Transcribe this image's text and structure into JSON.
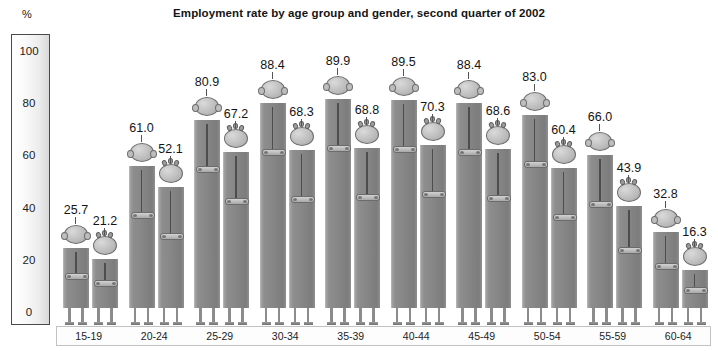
{
  "chart_data": {
    "type": "bar",
    "title": "Employment rate by age group and gender, second quarter of 2002",
    "xlabel": "",
    "ylabel": "%",
    "ylim": [
      0,
      100
    ],
    "yticks": [
      0,
      20,
      40,
      60,
      80,
      100
    ],
    "grid": false,
    "legend_position": "none",
    "categories": [
      "15-19",
      "20-24",
      "25-29",
      "30-34",
      "35-39",
      "40-44",
      "45-49",
      "50-54",
      "55-59",
      "60-64"
    ],
    "series": [
      {
        "name": "Men",
        "values": [
          25.7,
          61.0,
          80.9,
          88.4,
          89.9,
          89.5,
          88.4,
          83.0,
          66.0,
          32.8
        ]
      },
      {
        "name": "Women",
        "values": [
          21.2,
          52.1,
          67.2,
          68.3,
          68.8,
          70.3,
          68.6,
          60.4,
          43.9,
          16.3
        ]
      }
    ],
    "value_labels": [
      "25.7",
      "21.2",
      "61.0",
      "52.1",
      "80.9",
      "67.2",
      "88.4",
      "68.3",
      "89.9",
      "68.8",
      "89.5",
      "70.3",
      "88.4",
      "68.6",
      "83.0",
      "60.4",
      "66.0",
      "43.9",
      "32.8",
      "16.3"
    ],
    "ytick_labels": [
      "100",
      "80",
      "60",
      "40",
      "20",
      "0"
    ],
    "colors": {
      "bar": "#878787",
      "head": "#c3c3c3",
      "axis_border": "#4a4a4a",
      "text": "#141414"
    }
  }
}
